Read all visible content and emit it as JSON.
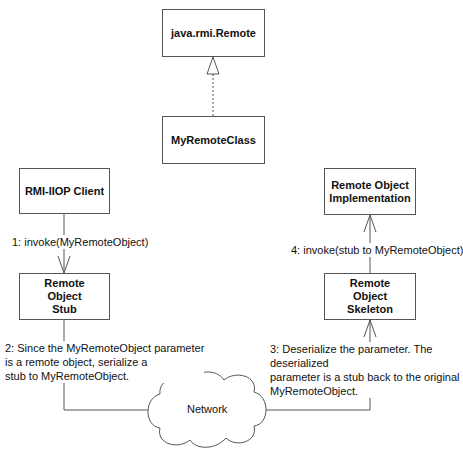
{
  "diagram": {
    "nodes": {
      "remote_interface": {
        "label": "java.rmi.Remote"
      },
      "remote_class": {
        "label": "MyRemoteClass"
      },
      "client": {
        "label": "RMI-IIOP Client"
      },
      "stub": {
        "label": "Remote Object Stub"
      },
      "implementation": {
        "label": "Remote Object Implementation"
      },
      "skeleton": {
        "label": "Remote Object Skeleton"
      },
      "network": {
        "label": "Network"
      }
    },
    "edges": {
      "generalization": {
        "from": "MyRemoteClass",
        "to": "java.rmi.Remote",
        "style": "dashed",
        "arrow": "hollow-triangle"
      },
      "step1": {
        "label": "1: invoke(MyRemoteObject)"
      },
      "step2": {
        "label": "2: Since the MyRemoteObject parameter\nis a remote object,  serialize a\nstub to MyRemoteObject."
      },
      "step3": {
        "label": "3: Deserialize the parameter.  The deserialized\nparameter is a stub back to the original\nMyRemoteObject."
      },
      "step4": {
        "label": "4: invoke(stub to MyRemoteObject)"
      }
    },
    "colors": {
      "line": "#555555",
      "text": "#111111",
      "background": "#ffffff"
    }
  }
}
